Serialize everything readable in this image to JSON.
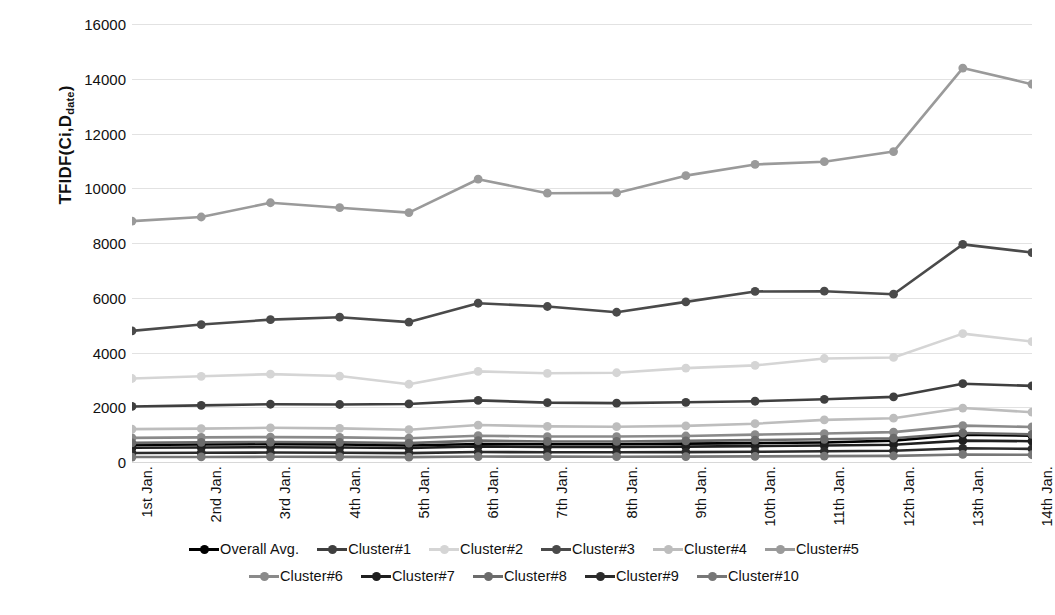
{
  "chart_data": {
    "type": "line",
    "title": "",
    "xlabel": "",
    "ylabel": "TFIDF(Ci,D_date)",
    "ylabel_main": "TFIDF(Ci,D",
    "ylabel_sub": "date",
    "ylabel_tail": ")",
    "ylim": [
      0,
      16000
    ],
    "yticks": [
      0,
      2000,
      4000,
      6000,
      8000,
      10000,
      12000,
      14000,
      16000
    ],
    "grid": true,
    "legend_position": "bottom",
    "categories": [
      "1st Jan.",
      "2nd Jan.",
      "3rd Jan.",
      "4th Jan.",
      "5th Jan.",
      "6th Jan.",
      "7th Jan.",
      "8th Jan.",
      "9th Jan.",
      "10th Jan.",
      "11th Jan.",
      "12th Jan.",
      "13th Jan.",
      "14th Jan."
    ],
    "series": [
      {
        "name": "Overall Avg.",
        "color": "#000000",
        "values": [
          620,
          640,
          650,
          645,
          600,
          660,
          650,
          650,
          670,
          690,
          710,
          780,
          1000,
          960
        ]
      },
      {
        "name": "Cluster#1",
        "color": "#3f3f3f",
        "values": [
          2030,
          2070,
          2110,
          2100,
          2120,
          2250,
          2170,
          2150,
          2180,
          2220,
          2290,
          2380,
          2860,
          2780
        ]
      },
      {
        "name": "Cluster#2",
        "color": "#d5d5d5",
        "values": [
          3050,
          3130,
          3210,
          3140,
          2840,
          3310,
          3240,
          3260,
          3430,
          3530,
          3780,
          3820,
          4690,
          4400
        ]
      },
      {
        "name": "Cluster#3",
        "color": "#4a4a4a",
        "values": [
          4790,
          5020,
          5200,
          5290,
          5110,
          5800,
          5680,
          5470,
          5850,
          6230,
          6240,
          6130,
          7950,
          7650
        ]
      },
      {
        "name": "Cluster#4",
        "color": "#bdbdbd",
        "values": [
          1200,
          1220,
          1250,
          1230,
          1180,
          1350,
          1300,
          1290,
          1320,
          1400,
          1540,
          1600,
          1970,
          1820
        ]
      },
      {
        "name": "Cluster#5",
        "color": "#9a9a9a",
        "values": [
          8800,
          8950,
          9470,
          9290,
          9110,
          10330,
          9820,
          9830,
          10460,
          10870,
          10970,
          11340,
          14390,
          13800
        ]
      },
      {
        "name": "Cluster#6",
        "color": "#8a8a8a",
        "values": [
          880,
          900,
          910,
          900,
          870,
          960,
          930,
          930,
          950,
          1000,
          1040,
          1090,
          1330,
          1280
        ]
      },
      {
        "name": "Cluster#7",
        "color": "#1f1f1f",
        "values": [
          520,
          530,
          540,
          530,
          510,
          570,
          550,
          550,
          560,
          580,
          600,
          630,
          780,
          760
        ]
      },
      {
        "name": "Cluster#8",
        "color": "#6b6b6b",
        "values": [
          700,
          720,
          730,
          720,
          690,
          780,
          750,
          750,
          770,
          800,
          830,
          870,
          1060,
          1010
        ]
      },
      {
        "name": "Cluster#9",
        "color": "#2b2b2b",
        "values": [
          330,
          340,
          345,
          340,
          325,
          365,
          355,
          355,
          360,
          375,
          390,
          410,
          500,
          480
        ]
      },
      {
        "name": "Cluster#10",
        "color": "#777777",
        "values": [
          180,
          185,
          190,
          188,
          178,
          200,
          195,
          193,
          198,
          205,
          215,
          225,
          275,
          265
        ]
      }
    ]
  },
  "legend": {
    "row1": [
      "Overall Avg.",
      "Cluster#1",
      "Cluster#2",
      "Cluster#3",
      "Cluster#4",
      "Cluster#5"
    ],
    "row2": [
      "Cluster#6",
      "Cluster#7",
      "Cluster#8",
      "Cluster#9",
      "Cluster#10"
    ]
  }
}
